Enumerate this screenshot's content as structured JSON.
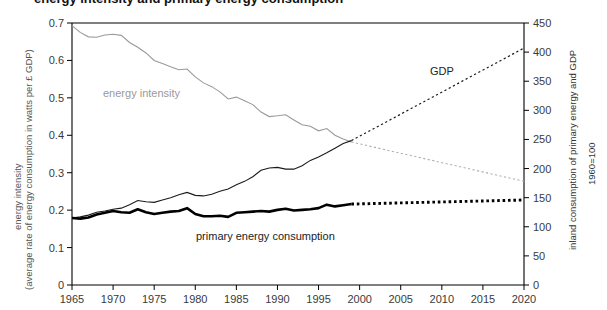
{
  "figure": {
    "title_clipped": "energy intensity and primary energy consumption",
    "background": "#ffffff"
  },
  "axes": {
    "left": {
      "title_line1": "energy intensity",
      "title_line2": "(average rate of energy consumption in watts per £ GDP)",
      "ticks": [
        "0",
        "0.1",
        "0.2",
        "0.3",
        "0.4",
        "0.5",
        "0.6",
        "0.7"
      ],
      "min": 0,
      "max": 0.7
    },
    "right": {
      "title": "inland consumption of primary energy and GDP",
      "subtitle": "1960=100",
      "ticks": [
        "0",
        "50",
        "100",
        "150",
        "200",
        "250",
        "300",
        "350",
        "400",
        "450"
      ],
      "min": 0,
      "max": 450
    },
    "bottom": {
      "ticks": [
        "1965",
        "1970",
        "1975",
        "1980",
        "1985",
        "1990",
        "1995",
        "2000",
        "2005",
        "2010",
        "2015",
        "2020"
      ],
      "min": 1965,
      "max": 2020
    }
  },
  "labels": {
    "energy_intensity": "energy intensity",
    "gdp": "GDP",
    "primary_energy": "primary energy consumption"
  },
  "colors": {
    "energy_intensity": "#9a9a9a",
    "gdp": "#1a1a1a",
    "primary_energy": "#000000",
    "axis": "#000000",
    "tick_text": "#3a3a3a"
  },
  "chart_data": {
    "type": "line",
    "title": "energy intensity and primary energy consumption",
    "xlabel": "",
    "ylabel": "energy intensity (average rate of energy consumption in watts per £ GDP)",
    "y2label": "inland consumption of primary energy and GDP (1960=100)",
    "xlim": [
      1965,
      2020
    ],
    "ylim": [
      0,
      0.7
    ],
    "y2lim": [
      0,
      450
    ],
    "grid": false,
    "legend": "inline-annotations",
    "series": [
      {
        "name": "energy intensity",
        "axis": "left",
        "style": "solid-thin-gray",
        "color": "#9a9a9a",
        "x": [
          1965,
          1966,
          1967,
          1968,
          1969,
          1970,
          1971,
          1972,
          1973,
          1974,
          1975,
          1976,
          1977,
          1978,
          1979,
          1980,
          1981,
          1982,
          1983,
          1984,
          1985,
          1986,
          1987,
          1988,
          1989,
          1990,
          1991,
          1992,
          1993,
          1994,
          1995,
          1996,
          1997,
          1998,
          1999
        ],
        "y": [
          0.693,
          0.675,
          0.663,
          0.662,
          0.668,
          0.67,
          0.667,
          0.648,
          0.635,
          0.62,
          0.6,
          0.592,
          0.583,
          0.575,
          0.577,
          0.556,
          0.54,
          0.53,
          0.516,
          0.497,
          0.502,
          0.492,
          0.482,
          0.462,
          0.45,
          0.452,
          0.455,
          0.441,
          0.428,
          0.424,
          0.412,
          0.418,
          0.4,
          0.39,
          0.382
        ]
      },
      {
        "name": "energy intensity (projection)",
        "axis": "left",
        "style": "dotted-thin-gray",
        "color": "#b0b0b0",
        "x": [
          1999,
          2020
        ],
        "y": [
          0.382,
          0.277
        ]
      },
      {
        "name": "GDP",
        "axis": "right",
        "style": "solid-thin-dark",
        "color": "#1a1a1a",
        "x": [
          1965,
          1966,
          1967,
          1968,
          1969,
          1970,
          1971,
          1972,
          1973,
          1974,
          1975,
          1976,
          1977,
          1978,
          1979,
          1980,
          1981,
          1982,
          1983,
          1984,
          1985,
          1986,
          1987,
          1988,
          1989,
          1990,
          1991,
          1992,
          1993,
          1994,
          1995,
          1996,
          1997,
          1998,
          1999
        ],
        "y": [
          115,
          117,
          120,
          125,
          127,
          130,
          132,
          138,
          145,
          143,
          142,
          146,
          150,
          155,
          159,
          154,
          153,
          156,
          161,
          165,
          172,
          178,
          186,
          197,
          201,
          202,
          199,
          199,
          205,
          214,
          220,
          227,
          235,
          243,
          248
        ]
      },
      {
        "name": "GDP (projection)",
        "axis": "right",
        "style": "dotted-thin-dark",
        "color": "#1a1a1a",
        "x": [
          1999,
          2020
        ],
        "y": [
          248,
          407
        ]
      },
      {
        "name": "primary energy consumption",
        "axis": "right",
        "style": "solid-thick-black",
        "color": "#000000",
        "x": [
          1965,
          1966,
          1967,
          1968,
          1969,
          1970,
          1971,
          1972,
          1973,
          1974,
          1975,
          1976,
          1977,
          1978,
          1979,
          1980,
          1981,
          1982,
          1983,
          1984,
          1985,
          1986,
          1987,
          1988,
          1989,
          1990,
          1991,
          1992,
          1993,
          1994,
          1995,
          1996,
          1997,
          1998,
          1999
        ],
        "y": [
          115,
          114,
          116,
          121,
          124,
          127,
          125,
          124,
          130,
          125,
          122,
          124,
          126,
          127,
          132,
          122,
          118,
          118,
          119,
          117,
          124,
          125,
          126,
          127,
          126,
          129,
          131,
          128,
          129,
          130,
          132,
          138,
          135,
          137,
          139
        ]
      },
      {
        "name": "primary energy consumption (projection)",
        "axis": "right",
        "style": "dotted-thick-black",
        "color": "#000000",
        "x": [
          1999,
          2020
        ],
        "y": [
          139,
          146
        ]
      }
    ],
    "annotations": [
      {
        "text": "energy intensity",
        "x": 1973.5,
        "y_left": 0.482,
        "color": "#9a9a9a"
      },
      {
        "text": "GDP",
        "x": 2006.5,
        "y_right": 340,
        "color": "#222222"
      },
      {
        "text": "primary energy consumption",
        "x": 1989,
        "y_right": 82,
        "color": "#222222"
      }
    ]
  }
}
